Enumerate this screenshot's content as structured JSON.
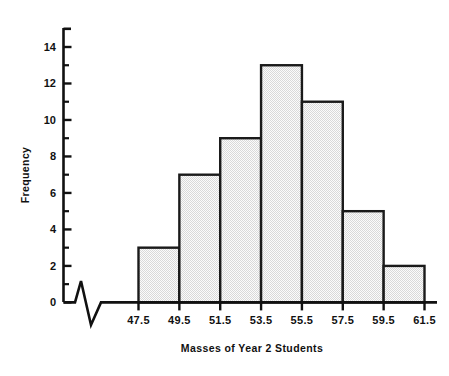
{
  "chart_data": {
    "type": "bar",
    "title": "",
    "subtitle": "",
    "xlabel": "Masses of Year 2 Students",
    "ylabel": "Frequency",
    "categories": [
      "47.5-49.5",
      "49.5-51.5",
      "51.5-53.5",
      "53.5-55.5",
      "55.5-57.5",
      "57.5-59.5",
      "59.5-61.5"
    ],
    "bin_edges": [
      47.5,
      49.5,
      51.5,
      53.5,
      55.5,
      57.5,
      59.5,
      61.5
    ],
    "values": [
      3,
      7,
      9,
      13,
      11,
      5,
      2
    ],
    "bin_width": 2,
    "total_frequency": 50,
    "xlim": [
      47.5,
      61.5
    ],
    "ylim": [
      0,
      15
    ],
    "x_tick_labels": [
      "47.5",
      "49.5",
      "51.5",
      "53.5",
      "55.5",
      "57.5",
      "59.5",
      "61.5"
    ],
    "y_tick_labels": [
      "0",
      "2",
      "4",
      "6",
      "8",
      "10",
      "12",
      "14"
    ],
    "y_major_ticks": [
      0,
      2,
      4,
      6,
      8,
      10,
      12,
      14
    ],
    "y_minor_ticks": [
      1,
      3,
      5,
      7,
      9,
      11,
      13
    ],
    "grid": false,
    "legend": false,
    "legend_position": "none",
    "x_axis_break": true,
    "x_axis_break_note": "zigzag break symbol between origin and first bin",
    "bar_fill_color": "#e8e8e8",
    "bar_edge_color": "#1a1a1a",
    "axis_color": "#111111",
    "background_color": "#ffffff"
  },
  "figure": {
    "ylabel": "Frequency",
    "xlabel": "Masses of Year 2 Students"
  }
}
